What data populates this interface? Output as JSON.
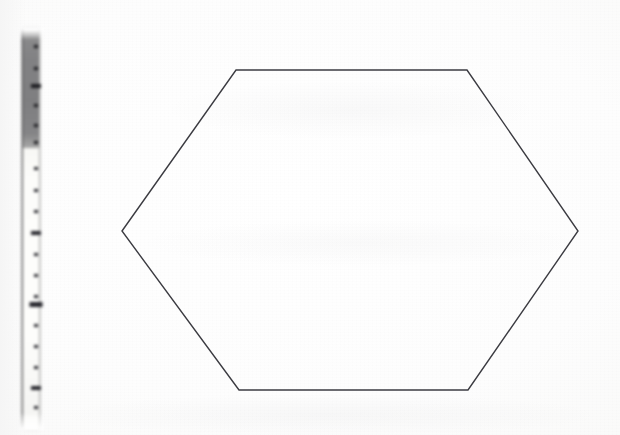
{
  "document": {
    "type": "scanned-drawing",
    "title": "Hexagon outline with scale ruler",
    "background_color": "#fdfdfd",
    "width": 620,
    "height": 435
  },
  "ruler": {
    "name": "measurement-ruler",
    "orientation": "vertical",
    "x": 24,
    "y": 31,
    "width": 24,
    "height": 396,
    "dark_band": {
      "label": "dark-gray-upper-segment",
      "color": "#7e7e80",
      "top": 3,
      "height": 117
    },
    "light_band": {
      "label": "light-lower-segment",
      "color": "#fcfcfa",
      "top": 120,
      "height": 268
    },
    "ticks": [
      {
        "y": 17,
        "size": "minor",
        "band": "dark"
      },
      {
        "y": 39,
        "size": "minor",
        "band": "dark"
      },
      {
        "y": 56,
        "size": "major",
        "band": "dark"
      },
      {
        "y": 76,
        "size": "minor",
        "band": "dark"
      },
      {
        "y": 96,
        "size": "minor",
        "band": "dark"
      },
      {
        "y": 113,
        "size": "minor",
        "band": "dark"
      },
      {
        "y": 139,
        "size": "minor",
        "band": "light"
      },
      {
        "y": 161,
        "size": "minor",
        "band": "light"
      },
      {
        "y": 182,
        "size": "minor",
        "band": "light"
      },
      {
        "y": 203,
        "size": "major",
        "band": "light"
      },
      {
        "y": 225,
        "size": "minor",
        "band": "light"
      },
      {
        "y": 246,
        "size": "minor",
        "band": "light"
      },
      {
        "y": 267,
        "size": "minor",
        "band": "light"
      },
      {
        "y": 274,
        "size": "index",
        "band": "light"
      },
      {
        "y": 296,
        "size": "minor",
        "band": "light"
      },
      {
        "y": 317,
        "size": "minor",
        "band": "light"
      },
      {
        "y": 338,
        "size": "minor",
        "band": "light"
      },
      {
        "y": 358,
        "size": "major",
        "band": "light"
      },
      {
        "y": 378,
        "size": "minor",
        "band": "light"
      }
    ]
  },
  "hexagon": {
    "name": "hexagon-outline",
    "stroke_color": "#3b3b41",
    "stroke_width": 1.4,
    "fill": "none",
    "vertices": [
      {
        "label": "left",
        "x": 122,
        "y": 231
      },
      {
        "label": "top-left",
        "x": 236,
        "y": 70
      },
      {
        "label": "top-right",
        "x": 467,
        "y": 70
      },
      {
        "label": "right",
        "x": 578,
        "y": 231
      },
      {
        "label": "bottom-right",
        "x": 468,
        "y": 390
      },
      {
        "label": "bottom-left",
        "x": 239,
        "y": 390
      }
    ]
  }
}
